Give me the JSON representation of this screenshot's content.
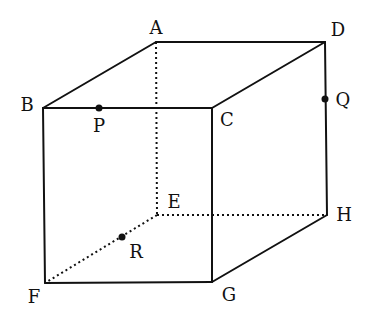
{
  "diagram": {
    "type": "cube-perspective",
    "colors": {
      "line": "#111111",
      "background": "#ffffff"
    },
    "vertices": [
      {
        "id": "A",
        "x": 156,
        "y": 42,
        "label": "A",
        "lx": 156,
        "ly": 29
      },
      {
        "id": "D",
        "x": 325,
        "y": 42,
        "label": "D",
        "lx": 338,
        "ly": 31
      },
      {
        "id": "B",
        "x": 43,
        "y": 108,
        "label": "B",
        "lx": 27,
        "ly": 106
      },
      {
        "id": "C",
        "x": 212,
        "y": 108,
        "label": "C",
        "lx": 227,
        "ly": 121
      },
      {
        "id": "E",
        "x": 157,
        "y": 215,
        "label": "E",
        "lx": 174,
        "ly": 203
      },
      {
        "id": "H",
        "x": 327,
        "y": 215,
        "label": "H",
        "lx": 344,
        "ly": 216
      },
      {
        "id": "F",
        "x": 45,
        "y": 283,
        "label": "F",
        "lx": 34,
        "ly": 298
      },
      {
        "id": "G",
        "x": 212,
        "y": 282,
        "label": "G",
        "lx": 229,
        "ly": 296
      }
    ],
    "points": [
      {
        "id": "P",
        "x": 99,
        "y": 108,
        "label": "P",
        "lx": 99,
        "ly": 127,
        "on_edge": "BC"
      },
      {
        "id": "Q",
        "x": 325,
        "y": 99,
        "label": "Q",
        "lx": 343,
        "ly": 101,
        "on_edge": "DH"
      },
      {
        "id": "R",
        "x": 122,
        "y": 237,
        "label": "R",
        "lx": 136,
        "ly": 253,
        "on_edge": "EF"
      }
    ],
    "solid_edges": [
      "AB",
      "AD",
      "BC",
      "CD",
      "BF",
      "CG",
      "DH",
      "FG",
      "GH"
    ],
    "hidden_edges": [
      "AE",
      "EF",
      "EH"
    ]
  }
}
